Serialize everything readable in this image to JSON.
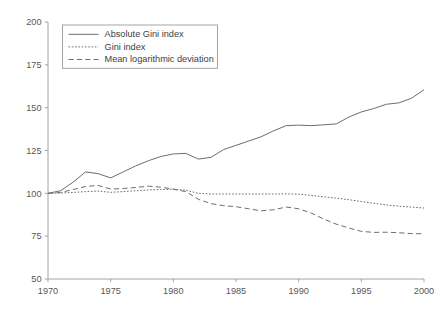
{
  "chart_data": {
    "type": "line",
    "title": "",
    "subtitle": "",
    "xlabel": "",
    "ylabel": "",
    "xlim": [
      1970,
      2000
    ],
    "ylim": [
      50,
      200
    ],
    "grid": false,
    "legend_position": "top-left",
    "xticks": [
      1970,
      1975,
      1980,
      1985,
      1990,
      1995,
      2000
    ],
    "xtick_labels": [
      "1970",
      "1975",
      "1980",
      "1985",
      "1990",
      "1995",
      "2000"
    ],
    "yticks": [
      50,
      75,
      100,
      125,
      150,
      175,
      200
    ],
    "ytick_labels": [
      "50",
      "75",
      "100",
      "125",
      "150",
      "175",
      "200"
    ],
    "x": [
      1970,
      1971,
      1972,
      1973,
      1974,
      1975,
      1976,
      1977,
      1978,
      1979,
      1980,
      1981,
      1982,
      1983,
      1984,
      1985,
      1986,
      1987,
      1988,
      1989,
      1990,
      1991,
      1992,
      1993,
      1994,
      1995,
      1996,
      1997,
      1998,
      1999,
      2000
    ],
    "series": [
      {
        "name": "Absolute Gini index",
        "style": "solid",
        "values": [
          100,
          101.5,
          106.5,
          112.5,
          111.5,
          109,
          112.5,
          116,
          119,
          121.5,
          123,
          123.3,
          120,
          121,
          125.5,
          128,
          130.5,
          133,
          136.5,
          139.5,
          139.8,
          139.5,
          140,
          140.5,
          144.5,
          147.5,
          149.5,
          152,
          152.8,
          155.5,
          160.5
        ]
      },
      {
        "name": "Gini index",
        "style": "dotted",
        "values": [
          100,
          100.2,
          100.5,
          101,
          101.3,
          100.6,
          101,
          101.5,
          102,
          102.2,
          102.4,
          101.8,
          100,
          99.6,
          99.6,
          99.6,
          99.6,
          99.6,
          99.6,
          99.7,
          99.5,
          98.8,
          98,
          97.2,
          96.3,
          95.2,
          94.2,
          93.2,
          92.5,
          92,
          91.4
        ]
      },
      {
        "name": "Mean logarithmic deviation",
        "style": "dashed",
        "values": [
          100,
          100.5,
          102.2,
          104,
          104.6,
          102.5,
          102.8,
          103.4,
          104.2,
          103.6,
          102.4,
          101,
          96.5,
          94,
          92.8,
          92.2,
          91,
          89.8,
          90.4,
          92,
          91,
          88.5,
          85,
          82,
          79.8,
          77.8,
          77.2,
          77.3,
          77,
          76.5,
          76.4
        ]
      }
    ]
  },
  "legend": {
    "items": [
      {
        "label": "Absolute Gini index",
        "style": "solid"
      },
      {
        "label": "Gini index",
        "style": "dotted"
      },
      {
        "label": "Mean logarithmic deviation",
        "style": "dashed"
      }
    ]
  },
  "colors": {
    "background": "#ffffff",
    "line": "#6d6d70",
    "axis": "#9a9a9c",
    "text": "#58585a"
  }
}
